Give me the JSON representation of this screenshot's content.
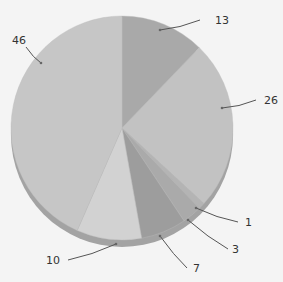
{
  "chart_data": {
    "type": "pie",
    "style": "3d-grayscale",
    "title": "",
    "start_angle_deg": 0,
    "direction": "clockwise",
    "slices": [
      {
        "label": "13",
        "value": 13,
        "color": "#a9a9a9"
      },
      {
        "label": "26",
        "value": 26,
        "color": "#c2c2c2"
      },
      {
        "label": "1",
        "value": 1,
        "color": "#b4b4b4"
      },
      {
        "label": "3",
        "value": 3,
        "color": "#aaaaaa"
      },
      {
        "label": "7",
        "value": 7,
        "color": "#9d9d9d"
      },
      {
        "label": "10",
        "value": 10,
        "color": "#d2d2d2"
      },
      {
        "label": "46",
        "value": 46,
        "color": "#c6c6c6"
      }
    ],
    "labels": {
      "13": {
        "text": "13",
        "x": 215,
        "y": 24,
        "line": [
          [
            160,
            30
          ],
          [
            200,
            20
          ]
        ]
      },
      "26": {
        "text": "26",
        "x": 264,
        "y": 104,
        "line": [
          [
            222,
            108
          ],
          [
            256,
            100
          ]
        ]
      },
      "1": {
        "text": "1",
        "x": 245,
        "y": 226,
        "line": [
          [
            196,
            208
          ],
          [
            238,
            222
          ]
        ]
      },
      "3": {
        "text": "3",
        "x": 232,
        "y": 253,
        "line": [
          [
            188,
            220
          ],
          [
            228,
            249
          ]
        ]
      },
      "7": {
        "text": "7",
        "x": 193,
        "y": 272,
        "line": [
          [
            160,
            236
          ],
          [
            187,
            268
          ]
        ]
      },
      "10": {
        "text": "10",
        "x": 46,
        "y": 264,
        "line": [
          [
            116,
            244
          ],
          [
            68,
            260
          ]
        ]
      },
      "46": {
        "text": "46",
        "x": 12,
        "y": 44,
        "line": [
          [
            41,
            63
          ],
          [
            26,
            47
          ]
        ]
      }
    },
    "legend": null
  },
  "geometry": {
    "cx": 122,
    "cy": 128,
    "rx": 111,
    "ry": 112,
    "depth": 7,
    "rim_color": "#a3a3a3",
    "line_color": "#555555",
    "text_color": "#333333"
  }
}
